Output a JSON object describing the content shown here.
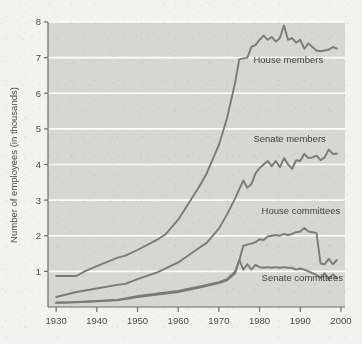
{
  "chart_data": {
    "type": "line",
    "title": "",
    "subtitle": "",
    "xlabel": "",
    "ylabel": "Number of employees (in thousands)",
    "xlim": [
      1928,
      2001
    ],
    "ylim": [
      0,
      8
    ],
    "xticks": [
      1930,
      1940,
      1950,
      1960,
      1970,
      1980,
      1990,
      2000
    ],
    "xticklabels": [
      "1930",
      "1940",
      "1950",
      "1960",
      "1970",
      "1980",
      "1990",
      "2000"
    ],
    "yticks": [
      1,
      2,
      3,
      4,
      5,
      6,
      7,
      8
    ],
    "yticklabels": [
      "1",
      "2",
      "3",
      "4",
      "5",
      "6",
      "7",
      "8"
    ],
    "grid": "horizontal-only",
    "gridcolor": "#ffffff",
    "plot_background": "#d6d6d4",
    "page_background": "#f2f2f0",
    "line_color": "#7a7a7a",
    "legend_position": "inline-annotations",
    "annotations": [
      {
        "text": "House members",
        "x": 1978.5,
        "y": 6.85
      },
      {
        "text": "Senate members",
        "x": 1978.5,
        "y": 4.62
      },
      {
        "text": "House committees",
        "x": 1980.5,
        "y": 2.62
      },
      {
        "text": "Senate committees",
        "x": 1980.5,
        "y": 0.72
      }
    ],
    "series": [
      {
        "name": "House members",
        "x": [
          1930,
          1935,
          1937,
          1940,
          1945,
          1947,
          1950,
          1955,
          1957,
          1960,
          1965,
          1967,
          1970,
          1972,
          1974,
          1975,
          1976,
          1977,
          1978,
          1979,
          1980,
          1981,
          1982,
          1983,
          1984,
          1985,
          1986,
          1987,
          1988,
          1989,
          1990,
          1991,
          1992,
          1993,
          1994,
          1995,
          1996,
          1997,
          1998,
          1999
        ],
        "values": [
          0.87,
          0.87,
          1.0,
          1.15,
          1.38,
          1.44,
          1.6,
          1.9,
          2.05,
          2.45,
          3.35,
          3.75,
          4.55,
          5.3,
          6.3,
          6.95,
          6.98,
          7.0,
          7.3,
          7.35,
          7.5,
          7.62,
          7.5,
          7.58,
          7.45,
          7.55,
          7.9,
          7.5,
          7.55,
          7.42,
          7.5,
          7.25,
          7.4,
          7.3,
          7.2,
          7.18,
          7.2,
          7.22,
          7.3,
          7.25
        ]
      },
      {
        "name": "Senate members",
        "x": [
          1930,
          1935,
          1940,
          1945,
          1947,
          1950,
          1955,
          1960,
          1965,
          1967,
          1970,
          1972,
          1974,
          1975,
          1976,
          1977,
          1978,
          1979,
          1980,
          1981,
          1982,
          1983,
          1984,
          1985,
          1986,
          1987,
          1988,
          1989,
          1990,
          1991,
          1992,
          1993,
          1994,
          1995,
          1996,
          1997,
          1998,
          1999
        ],
        "values": [
          0.28,
          0.42,
          0.52,
          0.62,
          0.65,
          0.78,
          0.98,
          1.25,
          1.65,
          1.8,
          2.2,
          2.6,
          3.05,
          3.3,
          3.55,
          3.35,
          3.45,
          3.75,
          3.9,
          4.0,
          4.1,
          3.95,
          4.1,
          3.92,
          4.18,
          4.0,
          3.88,
          4.12,
          4.1,
          4.3,
          4.18,
          4.2,
          4.25,
          4.12,
          4.2,
          4.42,
          4.3,
          4.3
        ]
      },
      {
        "name": "House committees",
        "x": [
          1930,
          1935,
          1940,
          1945,
          1947,
          1950,
          1955,
          1960,
          1965,
          1970,
          1972,
          1974,
          1975,
          1976,
          1977,
          1978,
          1979,
          1980,
          1981,
          1982,
          1983,
          1984,
          1985,
          1986,
          1987,
          1988,
          1989,
          1990,
          1991,
          1992,
          1993,
          1994,
          1995,
          1996,
          1997,
          1998,
          1999
        ],
        "values": [
          0.12,
          0.14,
          0.17,
          0.2,
          0.24,
          0.3,
          0.38,
          0.45,
          0.57,
          0.7,
          0.78,
          1.0,
          1.3,
          1.72,
          1.75,
          1.78,
          1.82,
          1.9,
          1.88,
          1.98,
          2.0,
          2.02,
          2.0,
          2.05,
          2.02,
          2.05,
          2.1,
          2.12,
          2.22,
          2.12,
          2.1,
          2.08,
          1.22,
          1.2,
          1.35,
          1.2,
          1.32
        ]
      },
      {
        "name": "Senate committees",
        "x": [
          1930,
          1935,
          1940,
          1945,
          1947,
          1950,
          1955,
          1960,
          1965,
          1970,
          1972,
          1974,
          1975,
          1976,
          1977,
          1978,
          1979,
          1980,
          1981,
          1982,
          1983,
          1984,
          1985,
          1986,
          1987,
          1988,
          1989,
          1990,
          1991,
          1992,
          1993,
          1994,
          1995,
          1996,
          1997,
          1998,
          1999
        ],
        "values": [
          0.12,
          0.13,
          0.16,
          0.19,
          0.22,
          0.28,
          0.35,
          0.42,
          0.54,
          0.67,
          0.75,
          0.95,
          1.32,
          1.05,
          1.2,
          1.05,
          1.18,
          1.12,
          1.1,
          1.12,
          1.1,
          1.12,
          1.1,
          1.12,
          1.1,
          1.1,
          1.05,
          1.08,
          1.05,
          1.0,
          0.95,
          0.9,
          0.82,
          0.95,
          0.78,
          0.92,
          0.8
        ]
      }
    ]
  }
}
